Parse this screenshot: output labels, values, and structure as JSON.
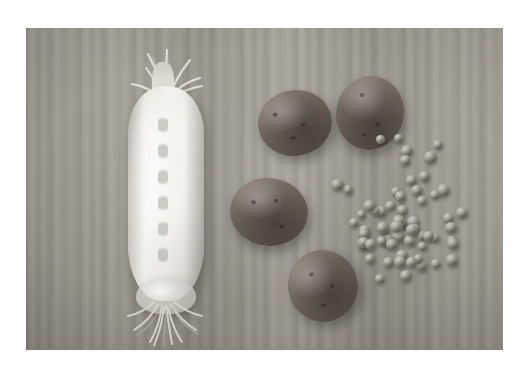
{
  "image": {
    "title": "Daikon radish, potatoes and green peas on a wooden cutting board",
    "alt_text": "Top-down photograph of one large white daikon radish with leafy top and root hairs, four unwashed potatoes, and a scattered pile of green peas arranged on a pale wooden board",
    "scene": "overhead still life of raw vegetables",
    "background": {
      "name": "wooden cutting board",
      "color": "#9e9a8f"
    },
    "frame": {
      "page_background": "#ffffff",
      "photo_left": 26,
      "photo_top": 28,
      "photo_width": 477,
      "photo_height": 322
    },
    "objects": [
      {
        "name": "daikon-radish",
        "label": "Daikon radish",
        "count": 1,
        "color": "#f2efe9",
        "parts": [
          "leafy stems",
          "white root body",
          "root hairs"
        ]
      },
      {
        "name": "potatoes",
        "label": "Potatoes",
        "count": 4,
        "color": "#6e6358"
      },
      {
        "name": "peas",
        "label": "Green peas",
        "count": 62,
        "color": "#8e8a78"
      }
    ]
  }
}
